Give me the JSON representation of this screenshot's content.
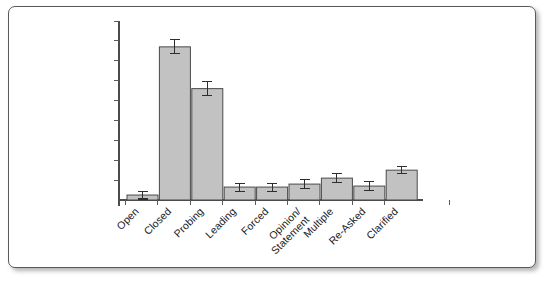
{
  "chart_data": {
    "type": "bar",
    "title": "",
    "subtitle": "",
    "xlabel": "",
    "ylabel": "",
    "categories": [
      "Open",
      "Closed",
      "Probing",
      "Leading",
      "Forced",
      "Opinion/\nStatement",
      "Multiple",
      "Re-Asked",
      "Clarified"
    ],
    "category_labels_multiline": [
      [
        "Open"
      ],
      [
        "Closed"
      ],
      [
        "Probing"
      ],
      [
        "Leading"
      ],
      [
        "Forced"
      ],
      [
        "Opinion/",
        "Statement"
      ],
      [
        "Multiple"
      ],
      [
        "Re-Asked"
      ],
      [
        "Clarified"
      ]
    ],
    "values": [
      0.25,
      7.7,
      5.6,
      0.65,
      0.65,
      0.8,
      1.1,
      0.7,
      1.5
    ],
    "errors": [
      0.2,
      0.35,
      0.35,
      0.2,
      0.2,
      0.22,
      0.22,
      0.22,
      0.18
    ],
    "ylim": [
      0,
      9
    ],
    "ytick_count": 9,
    "ytick_labels_shown": false,
    "grid": false,
    "legend": false,
    "legend_position": "none",
    "label_rotation_deg": 45,
    "bar_fill_color": "#c2c2c2",
    "bar_edge_color": "#4a4a4a",
    "error_bar_color": "#2e2e2e",
    "axis_color": "#4c4c4c",
    "background_color": "#ffffff",
    "border_color": "#5a5a5a"
  }
}
